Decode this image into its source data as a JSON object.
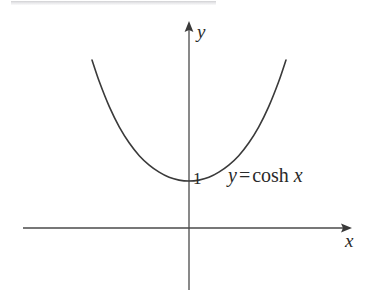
{
  "figure": {
    "name": "graph-of-hyperbolic-cosine",
    "background_color": "#ffffff",
    "ink_color": "#3a3a3a",
    "text_color": "#2a2a2a",
    "artifact_bar_color": "#aaaaaf"
  },
  "labels": {
    "y_axis": "y",
    "x_axis": "x",
    "y_intercept": "1",
    "equation_var_y": "y",
    "equation_equals": "=",
    "equation_function": "cosh",
    "equation_var_x": "x",
    "equation_full": "y = cosh x"
  },
  "chart_data": {
    "type": "line",
    "title": "",
    "subtitle": "",
    "xlabel": "x",
    "ylabel": "y",
    "annotations": [
      "y = cosh x",
      "1"
    ],
    "legend": [],
    "legend_position": "none",
    "grid": false,
    "axes": {
      "origin_px": [
        189,
        228
      ],
      "x_axis_from_px": [
        23,
        228
      ],
      "x_axis_to_px": [
        352,
        228
      ],
      "y_axis_from_px": [
        189,
        290
      ],
      "y_axis_to_px": [
        189,
        22
      ],
      "x_arrow": "right",
      "y_arrow": "up"
    },
    "xlim": [
      -1.95,
      1.95
    ],
    "ylim": [
      0,
      4.1
    ],
    "x": [
      -1.95,
      -1.8,
      -1.6,
      -1.4,
      -1.2,
      -1.0,
      -0.8,
      -0.6,
      -0.4,
      -0.2,
      0.0,
      0.2,
      0.4,
      0.6,
      0.8,
      1.0,
      1.2,
      1.4,
      1.6,
      1.8,
      1.95
    ],
    "series": [
      {
        "name": "y = cosh x",
        "values": [
          3.58,
          3.11,
          2.58,
          2.15,
          1.81,
          1.54,
          1.34,
          1.19,
          1.08,
          1.02,
          1.0,
          1.02,
          1.08,
          1.19,
          1.34,
          1.54,
          1.81,
          2.15,
          2.58,
          3.11,
          3.58
        ],
        "color": "#3a3a3a"
      }
    ],
    "key_points": [
      {
        "label": "1",
        "x": 0,
        "y": 1,
        "note": "minimum / y-intercept"
      }
    ]
  }
}
